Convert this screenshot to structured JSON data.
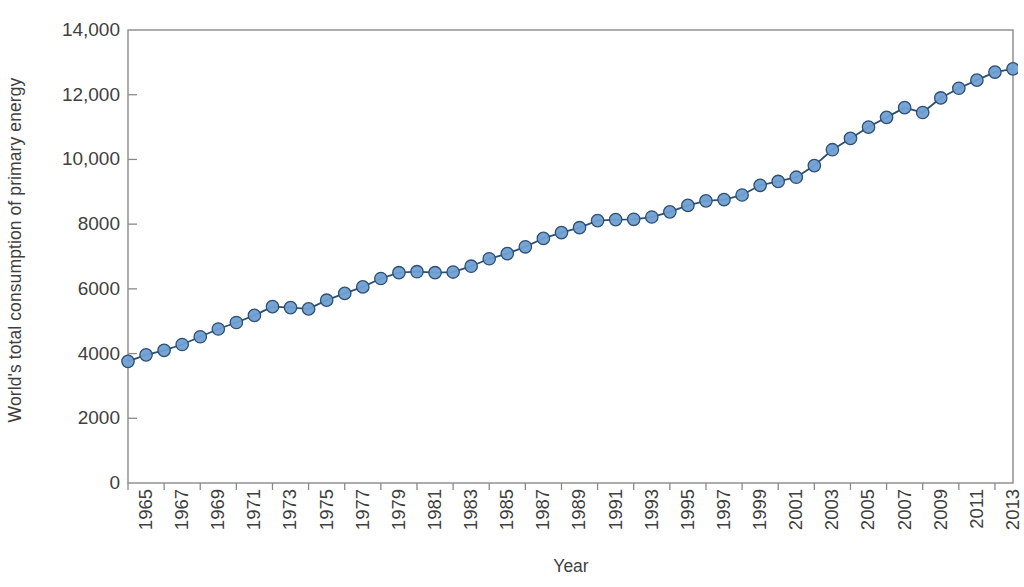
{
  "chart_data": {
    "type": "line",
    "title": "",
    "xlabel": "Year",
    "ylabel": "World's total consumption of primary energy",
    "xlim": [
      1965,
      2014
    ],
    "ylim": [
      0,
      14000
    ],
    "grid": false,
    "legend": "none",
    "marker": "circle",
    "marker_fill": "#6f9fd2",
    "marker_edge": "#2d4f72",
    "line_color": "#2d4f72",
    "axis_color": "#8a8a8a",
    "y_ticks": [
      0,
      2000,
      4000,
      6000,
      8000,
      10000,
      12000,
      14000
    ],
    "y_tick_labels": [
      "0",
      "2000",
      "4000",
      "6000",
      "8000",
      "10,000",
      "12,000",
      "14,000"
    ],
    "x_ticks": [
      1965,
      1967,
      1969,
      1971,
      1973,
      1975,
      1977,
      1979,
      1981,
      1983,
      1985,
      1987,
      1989,
      1991,
      1993,
      1995,
      1997,
      1999,
      2001,
      2003,
      2005,
      2007,
      2009,
      2011,
      2013
    ],
    "x_tick_labels": [
      "1965",
      "1967",
      "1969",
      "1971",
      "1973",
      "1975",
      "1977",
      "1979",
      "1981",
      "1983",
      "1985",
      "1987",
      "1989",
      "1991",
      "1993",
      "1995",
      "1997",
      "1999",
      "2001",
      "2003",
      "2005",
      "2007",
      "2009",
      "2011",
      "2013"
    ],
    "x": [
      1965,
      1966,
      1967,
      1968,
      1969,
      1970,
      1971,
      1972,
      1973,
      1974,
      1975,
      1976,
      1977,
      1978,
      1979,
      1980,
      1981,
      1982,
      1983,
      1984,
      1985,
      1986,
      1987,
      1988,
      1989,
      1990,
      1991,
      1992,
      1993,
      1994,
      1995,
      1996,
      1997,
      1998,
      1999,
      2000,
      2001,
      2002,
      2003,
      2004,
      2005,
      2006,
      2007,
      2008,
      2009,
      2010,
      2011,
      2012,
      2013,
      2014
    ],
    "values": [
      3760,
      3960,
      4100,
      4280,
      4520,
      4760,
      4960,
      5180,
      5450,
      5420,
      5380,
      5650,
      5860,
      6060,
      6320,
      6500,
      6530,
      6500,
      6520,
      6700,
      6930,
      7090,
      7300,
      7560,
      7740,
      7890,
      8110,
      8140,
      8150,
      8220,
      8380,
      8580,
      8720,
      8760,
      8900,
      9200,
      9320,
      9450,
      9810,
      10300,
      10650,
      11000,
      11300,
      11600,
      11450,
      11900,
      12200,
      12450,
      12700,
      12800
    ],
    "series": [
      {
        "name": "World primary energy consumption",
        "values": [
          3760,
          3960,
          4100,
          4280,
          4520,
          4760,
          4960,
          5180,
          5450,
          5420,
          5380,
          5650,
          5860,
          6060,
          6320,
          6500,
          6530,
          6500,
          6520,
          6700,
          6930,
          7090,
          7300,
          7560,
          7740,
          7890,
          8110,
          8140,
          8150,
          8220,
          8380,
          8580,
          8720,
          8760,
          8900,
          9200,
          9320,
          9450,
          9810,
          10300,
          10650,
          11000,
          11300,
          11600,
          11450,
          11900,
          12200,
          12450,
          12700,
          12800
        ]
      }
    ]
  }
}
